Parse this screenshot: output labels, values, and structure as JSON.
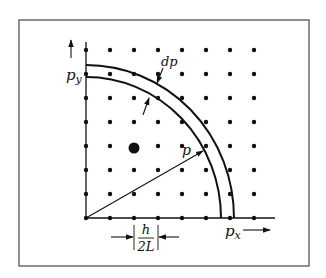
{
  "figure": {
    "frame": {
      "x": 19,
      "y": 20,
      "width": 290,
      "height": 246,
      "stroke": "#555555"
    },
    "origin": {
      "x": 86,
      "y": 218
    },
    "grid": {
      "columns_x": [
        86,
        110,
        134,
        158,
        182,
        206,
        230,
        254
      ],
      "rows_y": [
        218,
        194,
        170,
        146,
        122,
        98,
        74,
        50
      ],
      "dot_radius": 2.2,
      "dot_color": "#111111"
    },
    "highlight_point": {
      "x": 134,
      "y": 148,
      "radius": 5.5
    },
    "axes": {
      "x_axis_end": 275,
      "y_axis_top": 42
    },
    "shell": {
      "inner": {
        "rx": 135,
        "ry": 141
      },
      "outer": {
        "rx": 148,
        "ry": 153
      }
    },
    "vector_p": {
      "to_x": 203,
      "to_y": 151
    },
    "labels": {
      "p_x_base": "p",
      "p_x_sub": "x",
      "p_y_base": "p",
      "p_y_sub": "y",
      "dp": "dp",
      "p": "p",
      "h_numerator": "h",
      "h_denominator": "2L"
    }
  }
}
